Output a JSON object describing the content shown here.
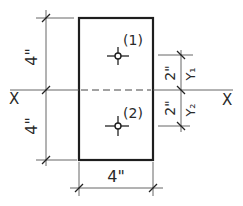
{
  "diagram": {
    "type": "cross-section",
    "section": {
      "width_label": "4\"",
      "x": 79,
      "y": 18,
      "w": 74,
      "h": 142
    },
    "x_axis": {
      "label_left": "X",
      "label_right": "X",
      "y": 90
    },
    "left_dimensions": [
      {
        "label": "4\"",
        "from_y": 18,
        "to_y": 90
      },
      {
        "label": "4\"",
        "from_y": 90,
        "to_y": 160
      }
    ],
    "right_dimensions": [
      {
        "label": "2\"",
        "sublabel": "Y₁",
        "from_y": 55,
        "to_y": 90
      },
      {
        "label": "2\"",
        "sublabel": "Y₂",
        "from_y": 90,
        "to_y": 126
      }
    ],
    "bottom_dimension": {
      "label": "4\"",
      "from_x": 79,
      "to_x": 153
    },
    "points": [
      {
        "id": "1",
        "label": "(1)",
        "x": 118,
        "y": 56
      },
      {
        "id": "2",
        "label": "(2)",
        "x": 118,
        "y": 126
      }
    ],
    "colors": {
      "ink": "#1e1e1e",
      "thin_ink": "#555555",
      "background": "#ffffff"
    }
  }
}
